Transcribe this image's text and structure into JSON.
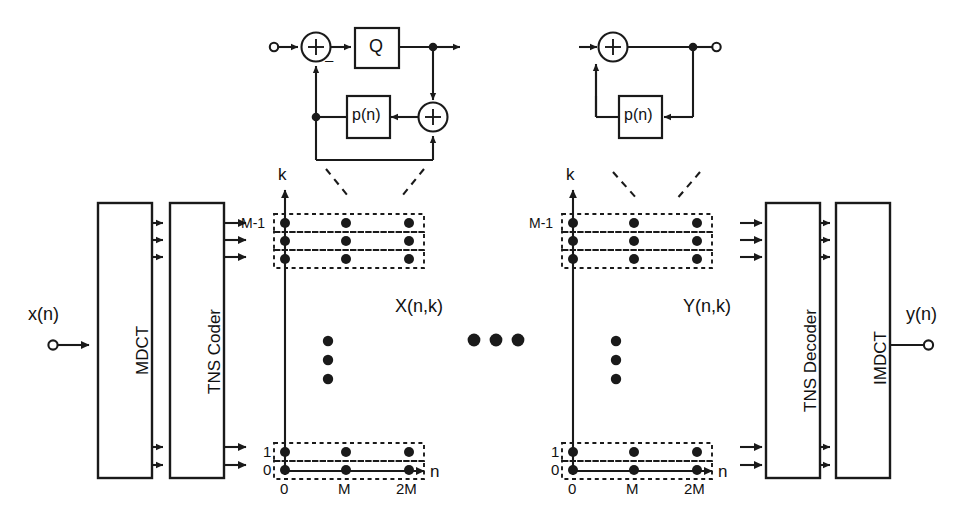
{
  "diagram": {
    "stroke_color": "#1a1a1a",
    "dash_color": "#1a1a1a"
  },
  "encoder": {
    "input_label": "x(n)",
    "blocks": [
      {
        "name": "mdct",
        "label": "MDCT"
      },
      {
        "name": "tns-coder",
        "label": "TNS Coder"
      }
    ]
  },
  "decoder": {
    "output_label": "y(n)",
    "blocks": [
      {
        "name": "tns-decoder",
        "label": "TNS Decoder"
      },
      {
        "name": "imdct",
        "label": "IMDCT"
      }
    ]
  },
  "encoder_detail": {
    "name": "tns-encoder-filter-detail",
    "quantizer_label": "Q",
    "predictor_label": "p(n)",
    "sum_symbol": "+",
    "minus_symbol": "–"
  },
  "decoder_detail": {
    "name": "tns-decoder-filter-detail",
    "predictor_label": "p(n)",
    "sum_symbol": "+"
  },
  "grid_left": {
    "name": "coefficient-grid-x",
    "signal_label": "X(n,k)",
    "y_axis_label": "k",
    "x_axis_label": "n",
    "y_ticks": [
      "M-1",
      "1",
      "0"
    ],
    "x_ticks": [
      "0",
      "M",
      "2M"
    ],
    "rows_top_count": 3,
    "rows_bottom_count": 2,
    "columns_count": 3,
    "vertical_ellipsis_count": 3
  },
  "grid_right": {
    "name": "coefficient-grid-y",
    "signal_label": "Y(n,k)",
    "y_axis_label": "k",
    "x_axis_label": "n",
    "y_ticks": [
      "M-1",
      "1",
      "0"
    ],
    "x_ticks": [
      "0",
      "M",
      "2M"
    ],
    "rows_top_count": 3,
    "rows_bottom_count": 2,
    "columns_count": 3,
    "vertical_ellipsis_count": 3
  },
  "transmission": {
    "name": "transmission-ellipsis",
    "dots": 3
  }
}
